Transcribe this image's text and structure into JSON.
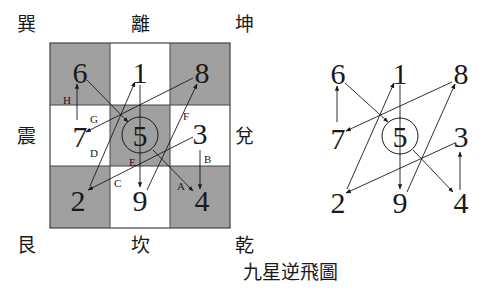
{
  "trigrams": {
    "top_left": "巽",
    "top": "離",
    "top_right": "坤",
    "left": "震",
    "right": "兌",
    "bottom_left": "艮",
    "bottom": "坎",
    "bottom_right": "乾"
  },
  "grid": {
    "cells": [
      {
        "pos": "NW",
        "number": "6",
        "shaded": true
      },
      {
        "pos": "N",
        "number": "1",
        "shaded": false
      },
      {
        "pos": "NE",
        "number": "8",
        "shaded": true
      },
      {
        "pos": "W",
        "number": "7",
        "shaded": false
      },
      {
        "pos": "C",
        "number": "5",
        "shaded": true,
        "circled": true
      },
      {
        "pos": "E",
        "number": "3",
        "shaded": false
      },
      {
        "pos": "SW",
        "number": "2",
        "shaded": true
      },
      {
        "pos": "S",
        "number": "9",
        "shaded": false
      },
      {
        "pos": "SE",
        "number": "4",
        "shaded": true
      }
    ],
    "shade_color": "#a0a0a0",
    "path_labels": {
      "A": "A",
      "B": "B",
      "C": "C",
      "D": "D",
      "E": "E",
      "F": "F",
      "G": "G",
      "H": "H"
    }
  },
  "flight_path": [
    {
      "from": "5",
      "to": "4",
      "label": "A"
    },
    {
      "from": "4",
      "to": "3",
      "label": "B"
    },
    {
      "from": "3",
      "to": "2",
      "label": "C"
    },
    {
      "from": "2",
      "to": "1",
      "label": "D"
    },
    {
      "from": "1",
      "to": "9",
      "label": "E"
    },
    {
      "from": "9",
      "to": "8",
      "label": "F"
    },
    {
      "from": "8",
      "to": "7",
      "label": "G"
    },
    {
      "from": "7",
      "to": "6",
      "label": "H"
    },
    {
      "from": "6",
      "to": "5",
      "label": ""
    }
  ],
  "simplified": {
    "numbers": [
      "6",
      "1",
      "8",
      "7",
      "5",
      "3",
      "2",
      "9",
      "4"
    ]
  },
  "caption": "九星逆飛圖"
}
